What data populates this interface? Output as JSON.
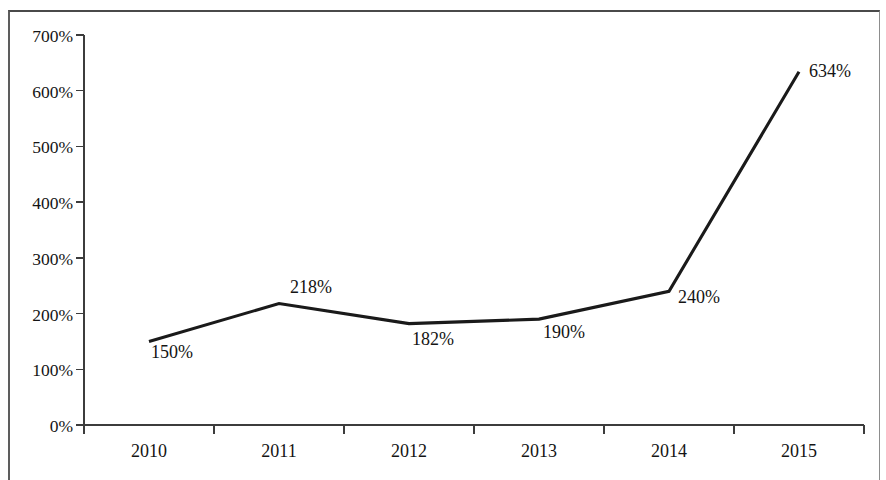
{
  "chart_data": {
    "type": "line",
    "title": "",
    "subtitle": "",
    "xlabel": "",
    "ylabel": "",
    "categories": [
      "2010",
      "2011",
      "2012",
      "2013",
      "2014",
      "2015"
    ],
    "x": [
      "2010",
      "2011",
      "2012",
      "2013",
      "2014",
      "2015"
    ],
    "values": [
      150,
      218,
      182,
      190,
      240,
      634
    ],
    "series": [
      {
        "name": "",
        "values": [
          150,
          218,
          182,
          190,
          240,
          634
        ],
        "point_labels": [
          "150%",
          "218%",
          "182%",
          "190%",
          "240%",
          "634%"
        ],
        "color": "#1a1a1a"
      }
    ],
    "ylim": [
      0,
      700
    ],
    "ytick_values": [
      0,
      100,
      200,
      300,
      400,
      500,
      600,
      700
    ],
    "ytick_labels": [
      "0%",
      "100%",
      "200%",
      "300%",
      "400%",
      "500%",
      "600%",
      "700%"
    ],
    "xtick_labels": [
      "2010",
      "2011",
      "2012",
      "2013",
      "2014",
      "2015"
    ],
    "value_format": "percent",
    "grid": false,
    "legend": false,
    "legend_position": "none",
    "data_labels_shown": true,
    "axis_color": "#3c3c3c",
    "line_color": "#1a1a1a",
    "background_color": "#ffffff"
  },
  "figure": {
    "plot_area": {
      "left": 84,
      "right": 864,
      "top": 35,
      "bottom": 425
    },
    "category_centers": [
      149,
      279,
      409,
      539,
      669,
      799
    ],
    "label_offsets": [
      {
        "dx": 2,
        "dy": 17
      },
      {
        "dx": 11,
        "dy": -11
      },
      {
        "dx": 3,
        "dy": 21
      },
      {
        "dx": 4,
        "dy": 19
      },
      {
        "dx": 9,
        "dy": 12
      },
      {
        "dx": 10,
        "dy": 5
      }
    ]
  }
}
